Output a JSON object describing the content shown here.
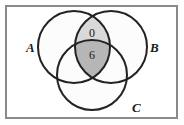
{
  "diagram": {
    "type": "venn-3-circle",
    "title_visible": false,
    "universe_rectangle": {
      "name": "universal-set-box",
      "x": 6,
      "y": 6,
      "width": 171,
      "height": 112,
      "stroke": "#8a8a8a",
      "fill": "#ffffff",
      "stroke_width": 2
    },
    "circles": [
      {
        "id": "A",
        "label": "A",
        "cx": 74,
        "cy": 47,
        "r": 36,
        "label_x": 26,
        "label_y": 52,
        "stroke": "#222222",
        "fill": "#fcfcfc"
      },
      {
        "id": "B",
        "label": "B",
        "cx": 111,
        "cy": 47,
        "r": 36,
        "label_x": 150,
        "label_y": 52,
        "stroke": "#222222",
        "fill": "#fcfcfc"
      },
      {
        "id": "C",
        "label": "C",
        "cx": 92,
        "cy": 75,
        "r": 35,
        "label_x": 132,
        "label_y": 112,
        "stroke": "#222222",
        "fill": "#fcfcfc"
      }
    ],
    "shaded_regions": [
      {
        "id": "A-and-B-not-C",
        "description": "A intersect B minus C",
        "value": "0",
        "fill": "#d9d9d9",
        "label_x": 92,
        "label_y": 37
      },
      {
        "id": "A-and-B-and-C",
        "description": "A intersect B intersect C",
        "value": "6",
        "fill": "#b6b6b6",
        "label_x": 92,
        "label_y": 59
      }
    ],
    "colors": {
      "outline": "#222222",
      "box_outline": "#8a8a8a",
      "light_shade": "#d9d9d9",
      "dark_shade": "#b6b6b6",
      "background": "#ffffff",
      "text": "#1a1a1a"
    }
  }
}
